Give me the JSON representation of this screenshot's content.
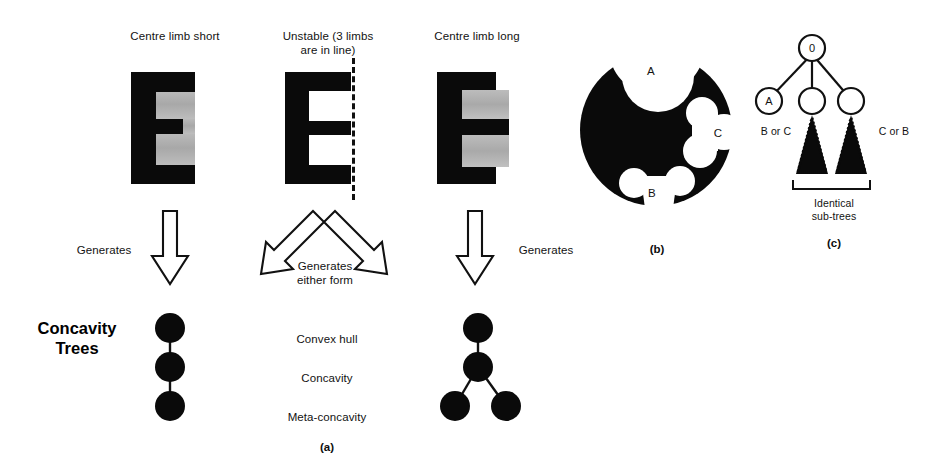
{
  "figure": {
    "panel_a": {
      "tag": "(a)",
      "columns": [
        {
          "heading": "Centre limb short",
          "arrow_label": "Generates",
          "shape_name": "letter-e-short-centre-limb",
          "tree_name": "chain-tree"
        },
        {
          "heading": "Unstable (3 limbs\nare in line)",
          "arrow_label": "Generates\neither form",
          "shape_name": "letter-e-flush-limbs",
          "tree_name": "none"
        },
        {
          "heading": "Centre limb long",
          "arrow_label": "Generates",
          "shape_name": "letter-e-long-centre-limb",
          "tree_name": "branch-tree"
        }
      ],
      "tree_title": "Concavity\nTrees",
      "level_labels": [
        "Convex hull",
        "Concavity",
        "Meta-concavity"
      ]
    },
    "panel_b": {
      "tag": "(b)",
      "shape_name": "black-disk-with-concavities",
      "region_labels": [
        "A",
        "B",
        "C"
      ],
      "colors": {
        "fill": "#0a0a0a",
        "background": "#ffffff"
      }
    },
    "panel_c": {
      "tag": "(c)",
      "root_label": "0",
      "child_labels": [
        "A",
        "",
        ""
      ],
      "left_subtree_label": "B or C",
      "right_subtree_label": "C or B",
      "bracket_label": "Identical\nsub-trees",
      "colors": {
        "node_stroke": "#111111",
        "subtree_fill": "#0a0a0a"
      }
    }
  }
}
